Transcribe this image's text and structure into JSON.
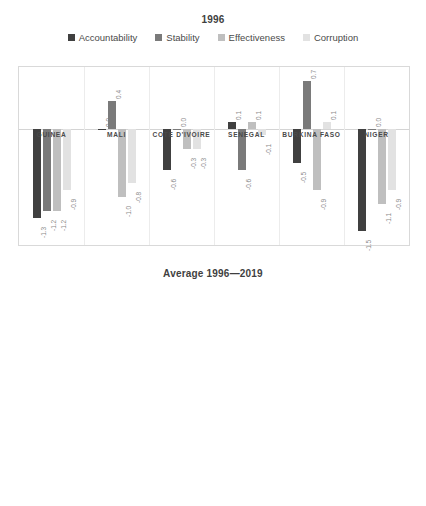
{
  "series_names": [
    "Accountability",
    "Stability",
    "Effectiveness",
    "Corruption"
  ],
  "series_colors": [
    "#404040",
    "#7a7a7a",
    "#bfbfbf",
    "#e2e2e2"
  ],
  "legend": {
    "items": [
      {
        "label": "Accountability",
        "color": "#404040"
      },
      {
        "label": "Stability",
        "color": "#7a7a7a"
      },
      {
        "label": "Effectiveness",
        "color": "#bfbfbf"
      },
      {
        "label": "Corruption",
        "color": "#e2e2e2"
      }
    ]
  },
  "chart_data": [
    {
      "type": "bar",
      "title": "1996",
      "xlabel": "",
      "ylabel": "",
      "ylim": [
        -1.7,
        0.9
      ],
      "grid": false,
      "legend_position": "top",
      "categories": [
        "GUINEA",
        "MALI",
        "COTE D'IVOIRE",
        "SENEGAL",
        "BURKINA FASO",
        "NIGER"
      ],
      "series": [
        {
          "name": "Accountability",
          "values": [
            -1.3,
            0.0,
            -0.6,
            0.1,
            -0.5,
            -1.5
          ]
        },
        {
          "name": "Stability",
          "values": [
            -1.2,
            0.4,
            0.0,
            -0.6,
            0.7,
            0.0
          ]
        },
        {
          "name": "Effectiveness",
          "values": [
            -1.2,
            -1.0,
            -0.3,
            0.1,
            -0.9,
            -1.1
          ]
        },
        {
          "name": "Corruption",
          "values": [
            -0.9,
            -0.8,
            -0.3,
            -0.1,
            0.1,
            -0.9
          ]
        }
      ],
      "data_labels": [
        [
          "-1.3",
          "-1.2",
          "-1.2",
          "-0.9"
        ],
        [
          "0.0",
          "0.4",
          "-1.0",
          "-0.8"
        ],
        [
          "-0.6",
          "0.0",
          "-0.3",
          "-0.3"
        ],
        [
          "0.1",
          "-0.6",
          "0.1",
          "-0.1"
        ],
        [
          "-0.5",
          "0.7",
          "-0.9",
          "0.1"
        ],
        [
          "-1.5",
          "0.0",
          "-1.1",
          "-0.9"
        ]
      ]
    },
    {
      "type": "bar",
      "title": "Average 1996—2019",
      "xlabel": "",
      "ylabel": "",
      "ylim": [
        -1.4,
        0.2
      ],
      "grid": true,
      "yticks": [
        "0.2",
        "0.0",
        "-0.2",
        "-0.4",
        "-0.6",
        "-0.8",
        "-1.0",
        "-1.2",
        "-1.4"
      ],
      "legend_position": "none",
      "categories": [
        "Guinea",
        "Mali",
        "Senegal",
        "Côte d'Ivoire",
        "Burkina Faso",
        "Niger"
      ],
      "series": [
        {
          "name": "Accountability",
          "values": [
            -1.05,
            -0.01,
            0.06,
            -0.81,
            -0.25,
            -0.44
          ]
        },
        {
          "name": "Stability",
          "values": [
            -1.24,
            -0.6,
            -0.24,
            -1.29,
            -0.34,
            -0.72
          ]
        },
        {
          "name": "Effectiveness",
          "values": [
            -1.04,
            -0.85,
            -0.27,
            -0.88,
            -0.61,
            -0.74
          ]
        },
        {
          "name": "Corruption",
          "values": [
            -1.02,
            -0.66,
            -0.15,
            -0.79,
            -0.22,
            -0.71
          ]
        }
      ]
    }
  ]
}
